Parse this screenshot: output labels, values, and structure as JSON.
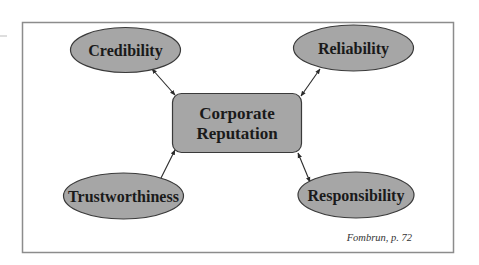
{
  "diagram": {
    "type": "hub-and-spoke",
    "colors": {
      "frame": "#8c8c8c",
      "node_fill": "#a6a6a6",
      "node_stroke": "#3a3a3a",
      "text": "#1a1a1a",
      "arrow": "#2a2a2a"
    },
    "center": {
      "label_line1": "Corporate",
      "label_line2": "Reputation"
    },
    "nodes": [
      {
        "id": "credibility",
        "label": "Credibility",
        "position": "top-left"
      },
      {
        "id": "reliability",
        "label": "Reliability",
        "position": "top-right"
      },
      {
        "id": "trustworthiness",
        "label": "Trustworthiness",
        "position": "bottom-left"
      },
      {
        "id": "responsibility",
        "label": "Responsibility",
        "position": "bottom-right"
      }
    ],
    "edges": [
      {
        "from": "credibility",
        "to": "center",
        "bidirectional": true
      },
      {
        "from": "reliability",
        "to": "center",
        "bidirectional": true
      },
      {
        "from": "trustworthiness",
        "to": "center",
        "bidirectional": true
      },
      {
        "from": "responsibility",
        "to": "center",
        "bidirectional": true
      }
    ],
    "caption": "Fombrun, p. 72"
  }
}
